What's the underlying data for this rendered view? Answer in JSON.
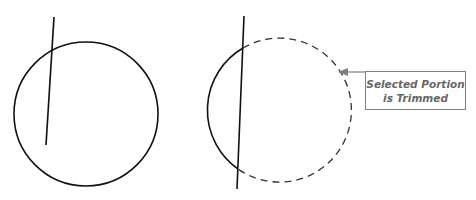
{
  "diagram": {
    "title": "",
    "colors": {
      "stroke": "#111111",
      "callout_border": "#808080",
      "callout_text": "#666666",
      "arrow": "#808080"
    },
    "before": {
      "circle": {
        "cx": 86,
        "cy": 114,
        "r": 72
      },
      "line": {
        "x1": 54,
        "y1": 17,
        "x2": 46,
        "y2": 145
      }
    },
    "after": {
      "circle": {
        "cx": 277,
        "cy": 110,
        "r": 72
      },
      "line": {
        "x1": 244,
        "y1": 16,
        "x2": 237,
        "y2": 189
      },
      "kept_arc": "solid left arc",
      "trimmed_arc": "dashed right arc"
    },
    "callout": {
      "line1": "Selected Portion",
      "line2": "is Trimmed"
    }
  }
}
